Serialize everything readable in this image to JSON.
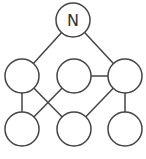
{
  "diagram": {
    "type": "graph",
    "stroke_color": "#444444",
    "fill_color": "#ffffff",
    "node_radius": 17,
    "nodes": [
      {
        "id": "n",
        "label": "N",
        "x": 73,
        "y": 20
      },
      {
        "id": "l",
        "label": "",
        "x": 22,
        "y": 76
      },
      {
        "id": "m",
        "label": "",
        "x": 74,
        "y": 76
      },
      {
        "id": "r",
        "label": "",
        "x": 125,
        "y": 76
      },
      {
        "id": "bl",
        "label": "",
        "x": 22,
        "y": 129
      },
      {
        "id": "bm",
        "label": "",
        "x": 74,
        "y": 129
      },
      {
        "id": "br",
        "label": "",
        "x": 125,
        "y": 129
      }
    ],
    "edges": [
      {
        "from": "n",
        "to": "l"
      },
      {
        "from": "n",
        "to": "r"
      },
      {
        "from": "l",
        "to": "bl"
      },
      {
        "from": "l",
        "to": "bm"
      },
      {
        "from": "m",
        "to": "bl"
      },
      {
        "from": "m",
        "to": "r"
      },
      {
        "from": "r",
        "to": "bm"
      },
      {
        "from": "r",
        "to": "br"
      }
    ]
  }
}
